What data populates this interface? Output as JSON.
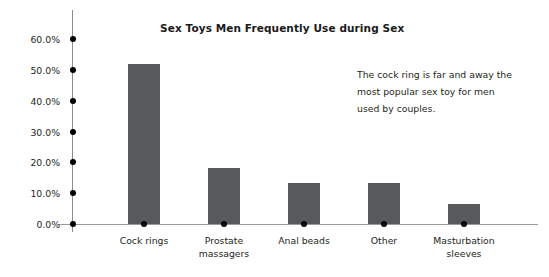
{
  "chart_data": {
    "type": "bar",
    "title": "Sex Toys Men Frequently Use during Sex",
    "xlabel": "",
    "ylabel": "",
    "categories": [
      "Cock rings",
      "Prostate massagers",
      "Anal beads",
      "Other",
      "Masturbation sleeves"
    ],
    "category_lines": [
      [
        "Cock rings"
      ],
      [
        "Prostate",
        "massagers"
      ],
      [
        "Anal beads"
      ],
      [
        "Other"
      ],
      [
        "Masturbation",
        "sleeves"
      ]
    ],
    "values": [
      52.0,
      18.2,
      13.3,
      13.3,
      6.5
    ],
    "ylim": [
      0,
      60
    ],
    "yticks": [
      0,
      10,
      20,
      30,
      40,
      50,
      60
    ],
    "ytick_labels": [
      "0.0%",
      "10.0%",
      "20.0%",
      "30.0%",
      "40.0%",
      "50.0%",
      "60.0%"
    ],
    "grid": false,
    "legend": null,
    "bar_color": "#58595B",
    "axis_color": "#9A9A9A",
    "text_color": "#231F20",
    "annotations": [
      "The cock ring is far and away the",
      "most popular sex toy for men",
      "used by couples."
    ]
  },
  "annotation": {
    "lines": [
      "The cock ring is far and away the",
      "most popular sex toy for men",
      "used by couples."
    ]
  }
}
